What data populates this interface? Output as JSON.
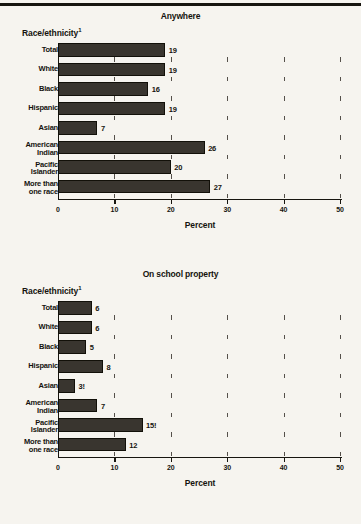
{
  "page": {
    "background_color": "#f6f4ef",
    "bar_color": "#39352f",
    "text_color": "#15130e",
    "group_axis_title": "Race/ethnicity",
    "group_axis_title_footnote": "1",
    "xaxis_title": "Percent",
    "xtick_labels": [
      "0",
      "10",
      "20",
      "30",
      "40",
      "50"
    ]
  },
  "chart_data": [
    {
      "type": "bar",
      "orientation": "horizontal",
      "title": "Anywhere",
      "xlabel": "Percent",
      "ylabel": "Race/ethnicity",
      "xlim": [
        0,
        50
      ],
      "xticks": [
        0,
        10,
        20,
        30,
        40,
        50
      ],
      "grid": false,
      "legend": "none",
      "categories": [
        "Total",
        "White",
        "Black",
        "Hispanic",
        "Asian",
        "American Indian",
        "Pacific Islander",
        "More than one race"
      ],
      "category_lines": [
        [
          "Total"
        ],
        [
          "White"
        ],
        [
          "Black"
        ],
        [
          "Hispanic"
        ],
        [
          "Asian"
        ],
        [
          "American",
          "Indian"
        ],
        [
          "Pacific",
          "Islander"
        ],
        [
          "More than",
          "one race"
        ]
      ],
      "values": [
        19,
        19,
        16,
        19,
        7,
        26,
        20,
        27
      ],
      "value_labels": [
        "19",
        "19",
        "16",
        "19",
        "7",
        "26",
        "20",
        "27"
      ]
    },
    {
      "type": "bar",
      "orientation": "horizontal",
      "title": "On school property",
      "xlabel": "Percent",
      "ylabel": "Race/ethnicity",
      "xlim": [
        0,
        50
      ],
      "xticks": [
        0,
        10,
        20,
        30,
        40,
        50
      ],
      "grid": false,
      "legend": "none",
      "categories": [
        "Total",
        "White",
        "Black",
        "Hispanic",
        "Asian",
        "American Indian",
        "Pacific Islander",
        "More than one race"
      ],
      "category_lines": [
        [
          "Total"
        ],
        [
          "White"
        ],
        [
          "Black"
        ],
        [
          "Hispanic"
        ],
        [
          "Asian"
        ],
        [
          "American",
          "Indian"
        ],
        [
          "Pacific",
          "Islander"
        ],
        [
          "More than",
          "one race"
        ]
      ],
      "values": [
        6,
        6,
        5,
        8,
        3,
        7,
        15,
        12
      ],
      "value_labels": [
        "6",
        "6",
        "5",
        "8",
        "3!",
        "7",
        "15!",
        "12"
      ]
    }
  ]
}
